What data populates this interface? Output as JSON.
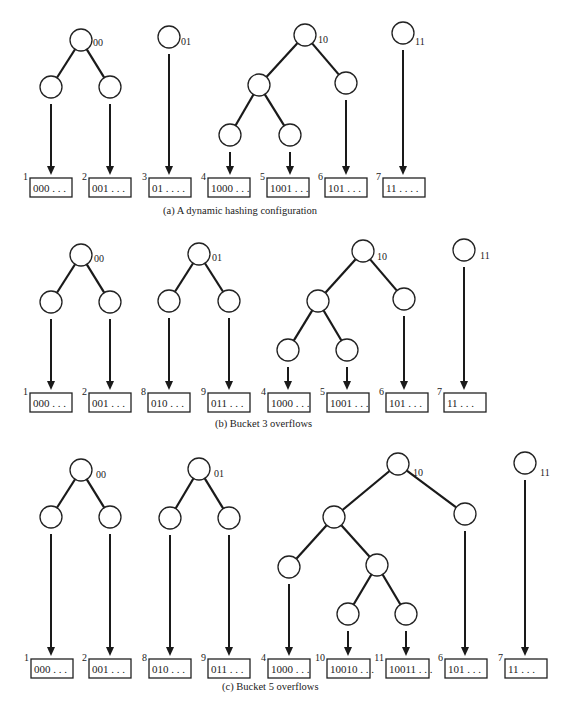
{
  "diagram": {
    "panels": [
      {
        "caption": "(a)  A dynamic hashing configuration",
        "trees": [
          {
            "label": "00",
            "buckets": [
              {
                "num": "1",
                "text": "000 . . ."
              },
              {
                "num": "2",
                "text": "001 . . ."
              }
            ]
          },
          {
            "label": "01",
            "buckets": [
              {
                "num": "3",
                "text": "01 . . . ."
              }
            ]
          },
          {
            "label": "10",
            "buckets": [
              {
                "num": "4",
                "text": "1000 . . ."
              },
              {
                "num": "5",
                "text": "1001 . . ."
              },
              {
                "num": "6",
                "text": "101 . . ."
              }
            ]
          },
          {
            "label": "11",
            "buckets": [
              {
                "num": "7",
                "text": "11 . . . ."
              }
            ]
          }
        ]
      },
      {
        "caption": "(b)  Bucket 3 overflows",
        "trees": [
          {
            "label": "00",
            "buckets": [
              {
                "num": "1",
                "text": "000 . . ."
              },
              {
                "num": "2",
                "text": "001 . . ."
              }
            ]
          },
          {
            "label": "01",
            "buckets": [
              {
                "num": "8",
                "text": "010 . . ."
              },
              {
                "num": "9",
                "text": "011 . . ."
              }
            ]
          },
          {
            "label": "10",
            "buckets": [
              {
                "num": "4",
                "text": "1000 . . ."
              },
              {
                "num": "5",
                "text": "1001 . . ."
              },
              {
                "num": "6",
                "text": "101 . . ."
              }
            ]
          },
          {
            "label": "11",
            "buckets": [
              {
                "num": "7",
                "text": "11 . . ."
              }
            ]
          }
        ]
      },
      {
        "caption": "(c)  Bucket 5 overflows",
        "trees": [
          {
            "label": "00",
            "buckets": [
              {
                "num": "1",
                "text": "000 . . ."
              },
              {
                "num": "2",
                "text": "001 . . ."
              }
            ]
          },
          {
            "label": "01",
            "buckets": [
              {
                "num": "8",
                "text": "010 . . ."
              },
              {
                "num": "9",
                "text": "011 . . ."
              }
            ]
          },
          {
            "label": "10",
            "buckets": [
              {
                "num": "4",
                "text": "1000 . . ."
              },
              {
                "num": "10",
                "text": "10010 . . ."
              },
              {
                "num": "11",
                "text": "10011 . . ."
              },
              {
                "num": "6",
                "text": "101 . . ."
              }
            ]
          },
          {
            "label": "11",
            "buckets": [
              {
                "num": "7",
                "text": "11 . . ."
              }
            ]
          }
        ]
      }
    ]
  }
}
